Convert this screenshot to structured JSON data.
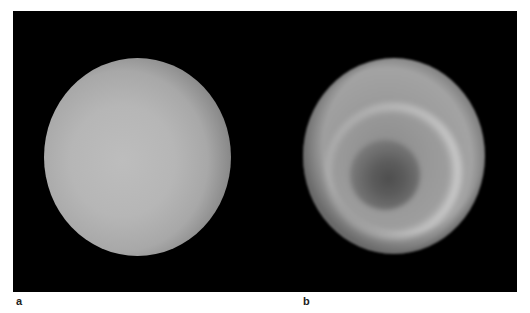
{
  "figure": {
    "panels": [
      {
        "label": "a",
        "description": "Uniformly bright gray sphere on black background",
        "colors": {
          "center": "#bdbdbd",
          "edge": "#1a1a1a"
        }
      },
      {
        "label": "b",
        "description": "Gray sphere with bright ring surrounding a dark central spot on black background",
        "colors": {
          "disc": "#999999",
          "ring": "#f0f0f0",
          "spot": "#4e4e4e"
        }
      }
    ],
    "background_color": "#000000",
    "page_color": "#ffffff"
  }
}
